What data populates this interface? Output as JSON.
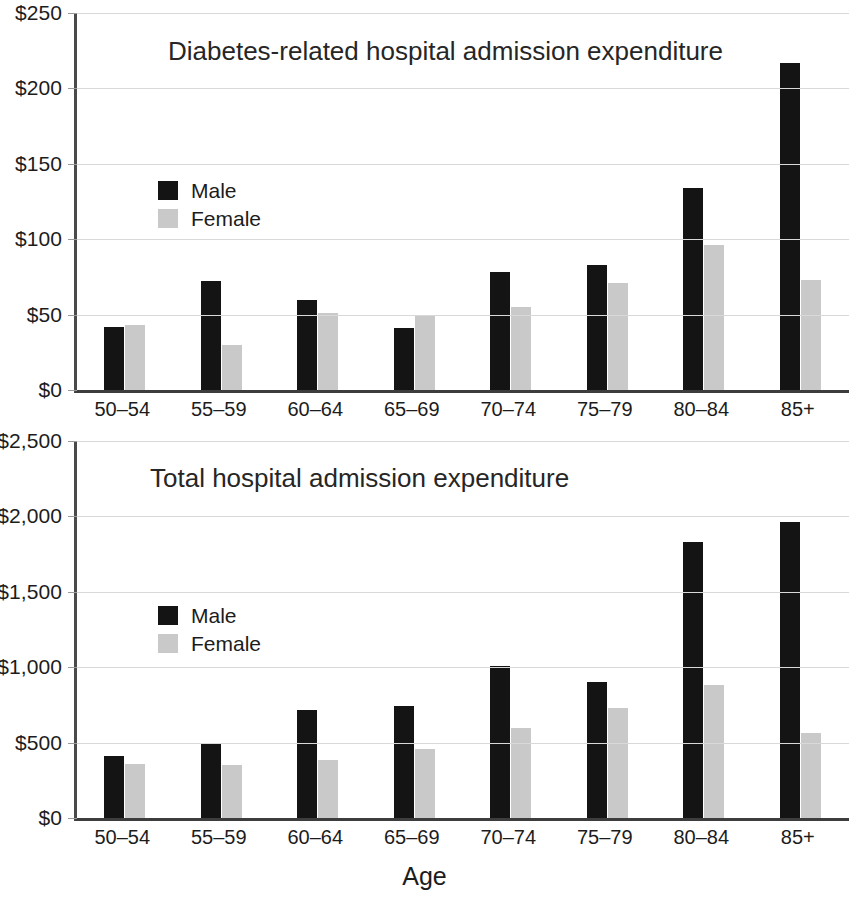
{
  "figure": {
    "xaxis_title": "Age"
  },
  "legend": {
    "male_label": "Male",
    "female_label": "Female"
  },
  "chart_data": [
    {
      "type": "bar",
      "title": "Diabetes-related hospital admission expenditure",
      "xlabel": "Age",
      "ylabel": "",
      "categories": [
        "50–54",
        "55–59",
        "60–64",
        "65–69",
        "70–74",
        "75–79",
        "80–84",
        "85+"
      ],
      "series": [
        {
          "name": "Male",
          "color": "#141414",
          "values": [
            42,
            72,
            60,
            41,
            78,
            83,
            134,
            217
          ]
        },
        {
          "name": "Female",
          "color": "#c9c9c9",
          "values": [
            43,
            30,
            51,
            50,
            55,
            71,
            96,
            73
          ]
        }
      ],
      "ylim": [
        0,
        250
      ],
      "yticks": [
        0,
        50,
        100,
        150,
        200,
        250
      ],
      "ytick_labels": [
        "$0",
        "$50",
        "$100",
        "$150",
        "$200",
        "$250"
      ],
      "grid": true,
      "legend_position": "inside-upper-left"
    },
    {
      "type": "bar",
      "title": "Total hospital admission expenditure",
      "xlabel": "Age",
      "ylabel": "",
      "categories": [
        "50–54",
        "55–59",
        "60–64",
        "65–69",
        "70–74",
        "75–79",
        "80–84",
        "85+"
      ],
      "series": [
        {
          "name": "Male",
          "color": "#141414",
          "values": [
            410,
            490,
            715,
            740,
            1010,
            905,
            1830,
            1960
          ]
        },
        {
          "name": "Female",
          "color": "#c9c9c9",
          "values": [
            355,
            350,
            385,
            460,
            600,
            730,
            885,
            565
          ]
        }
      ],
      "ylim": [
        0,
        2500
      ],
      "yticks": [
        0,
        500,
        1000,
        1500,
        2000,
        2500
      ],
      "ytick_labels": [
        "$0",
        "$500",
        "$1,000",
        "$1,500",
        "$2,000",
        "$2,500"
      ],
      "grid": true,
      "legend_position": "inside-upper-left"
    }
  ]
}
